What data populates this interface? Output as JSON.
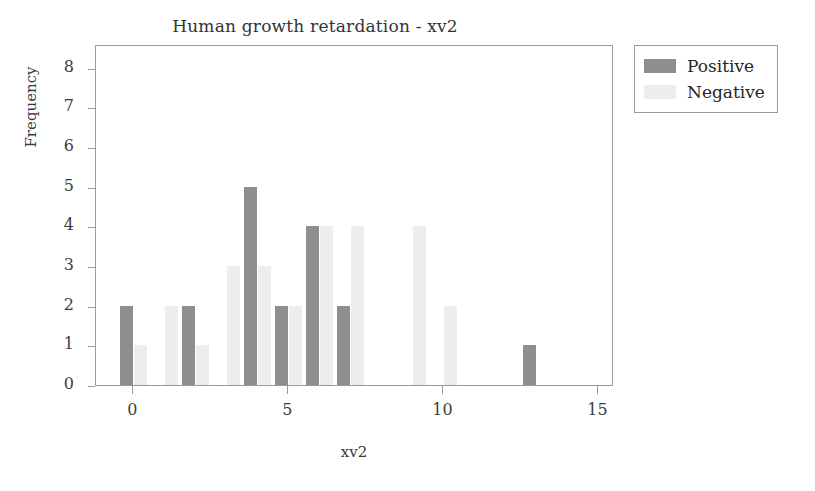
{
  "chart_data": {
    "type": "bar",
    "title": "Human growth retardation - xv2",
    "xlabel": "xv2",
    "ylabel": "Frequency",
    "xlim": [
      -1.2,
      15.5
    ],
    "ylim": [
      0,
      8.6
    ],
    "xticks": [
      "0",
      "5",
      "10",
      "15"
    ],
    "xtick_values": [
      0,
      5,
      10,
      15
    ],
    "yticks": [
      "0",
      "1",
      "2",
      "3",
      "4",
      "5",
      "6",
      "7",
      "8"
    ],
    "ytick_values": [
      0,
      1,
      2,
      3,
      4,
      5,
      6,
      7,
      8
    ],
    "grid": false,
    "legend_position": "upper right outside",
    "categories": [
      0,
      1,
      2,
      3,
      4,
      5,
      6,
      7,
      8,
      9,
      10,
      11,
      12,
      13,
      14,
      15
    ],
    "series": [
      {
        "name": "Positive",
        "color": "#8e8e8e",
        "values": [
          2,
          0,
          2,
          0,
          5,
          2,
          4,
          2,
          0,
          0,
          0,
          0,
          0,
          1,
          0,
          0
        ]
      },
      {
        "name": "Negative",
        "color": "#ededed",
        "values": [
          1,
          2,
          1,
          3,
          3,
          2,
          4,
          4,
          0,
          4,
          2,
          0,
          0,
          0,
          0,
          0
        ]
      }
    ]
  },
  "legend": {
    "entries": [
      {
        "label": "Positive",
        "swatch": "positive"
      },
      {
        "label": "Negative",
        "swatch": "negative"
      }
    ]
  },
  "colors": {
    "positive": "#8e8e8e",
    "negative": "#ededed",
    "axis": "#9a9a9a",
    "text": "#333333",
    "background": "#ffffff"
  }
}
